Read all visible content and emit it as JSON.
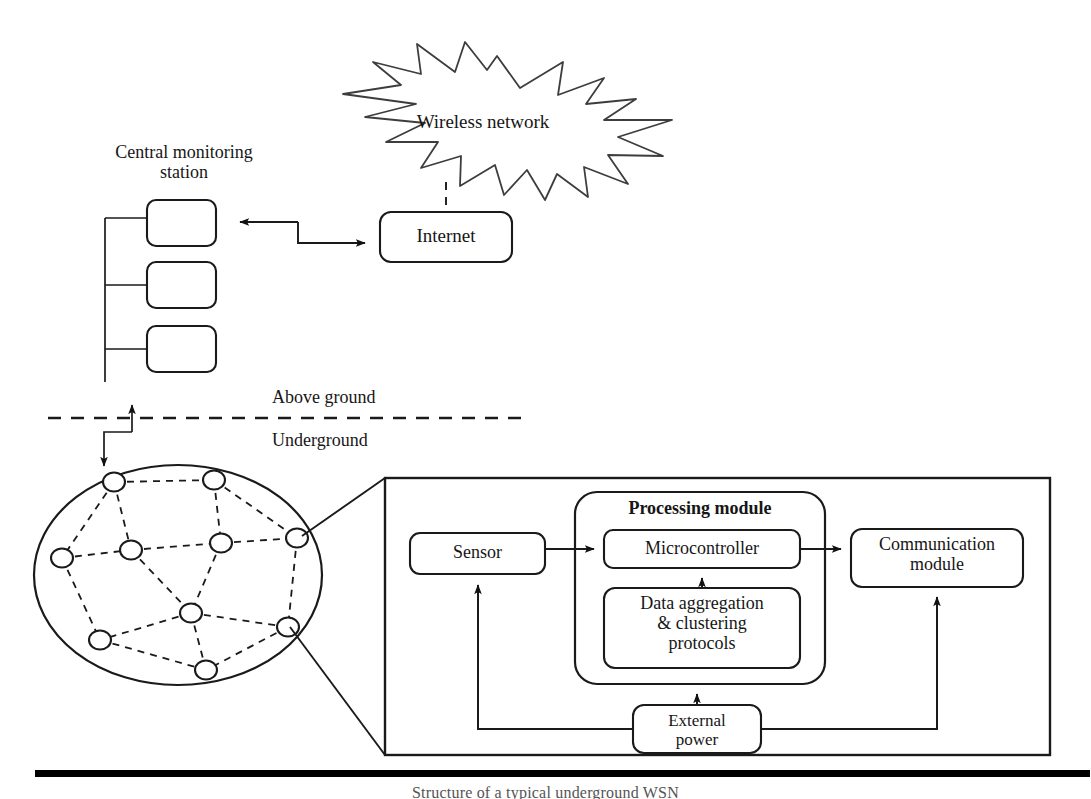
{
  "figure": {
    "caption": "Structure of a typical underground WSN"
  },
  "labels": {
    "wireless_network": "Wireless network",
    "central_monitoring_station": "Central monitoring\nstation",
    "internet": "Internet",
    "above_ground": "Above ground",
    "underground": "Underground",
    "sensor": "Sensor",
    "processing_module": "Processing module",
    "microcontroller": "Microcontroller",
    "data_aggregation": "Data aggregation\n& clustering\nprotocols",
    "communication_module": "Communication\nmodule",
    "external_power": "External\npower"
  },
  "monitoring_station": {
    "box_count": 3,
    "boxes": [
      "",
      "",
      ""
    ]
  },
  "sensor_field": {
    "node_count": 10,
    "nodes": [
      {
        "id": "n1",
        "x": 114,
        "y": 482
      },
      {
        "id": "n2",
        "x": 214,
        "y": 480
      },
      {
        "id": "n3",
        "x": 62,
        "y": 558
      },
      {
        "id": "n4",
        "x": 131,
        "y": 550
      },
      {
        "id": "n5",
        "x": 221,
        "y": 543
      },
      {
        "id": "n6",
        "x": 297,
        "y": 538
      },
      {
        "id": "n7",
        "x": 191,
        "y": 613
      },
      {
        "id": "n8",
        "x": 100,
        "y": 640
      },
      {
        "id": "n9",
        "x": 288,
        "y": 627
      },
      {
        "id": "n10",
        "x": 206,
        "y": 670
      }
    ],
    "links": [
      [
        "n1",
        "n2"
      ],
      [
        "n1",
        "n3"
      ],
      [
        "n1",
        "n4"
      ],
      [
        "n2",
        "n5"
      ],
      [
        "n2",
        "n6"
      ],
      [
        "n3",
        "n4"
      ],
      [
        "n3",
        "n8"
      ],
      [
        "n4",
        "n5"
      ],
      [
        "n4",
        "n7"
      ],
      [
        "n5",
        "n6"
      ],
      [
        "n5",
        "n7"
      ],
      [
        "n6",
        "n9"
      ],
      [
        "n7",
        "n8"
      ],
      [
        "n7",
        "n9"
      ],
      [
        "n7",
        "n10"
      ],
      [
        "n8",
        "n10"
      ],
      [
        "n9",
        "n10"
      ]
    ]
  },
  "colors": {
    "stroke": "#1a1a1a",
    "background": "#ffffff",
    "rule": "#000000"
  }
}
